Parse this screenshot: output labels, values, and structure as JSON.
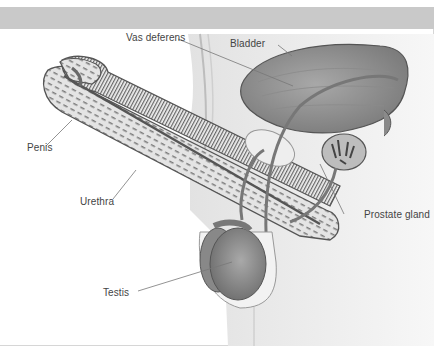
{
  "figure": {
    "labels": {
      "vas_deferens": "Vas deferens",
      "bladder": "Bladder",
      "penis": "Penis",
      "urethra": "Urethra",
      "prostate_gland": "Prostate gland",
      "testis": "Testis"
    },
    "colors": {
      "header_band": "#c9c9c9",
      "organ_fill": "#9a9a9a",
      "organ_dark": "#6f6f6f",
      "body_fill": "#ececec",
      "line": "#555555"
    }
  }
}
